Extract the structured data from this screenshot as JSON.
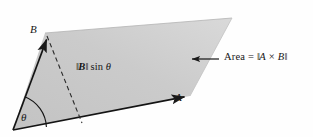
{
  "figure": {
    "background_color": "#fefefe",
    "fill_color": "#c9c9c9",
    "stroke_color": "#1a1a1a"
  },
  "labels": {
    "vector_b": "B",
    "vector_a": "A",
    "angle": "θ",
    "height_bar_open": "‖",
    "height_vector": "B",
    "height_bar_close": "‖",
    "height_function": " sin ",
    "height_angle": "θ",
    "area_word": "Area",
    "area_equals": "=",
    "area_bar_open": "‖",
    "area_first": "A",
    "area_times": "×",
    "area_second": "B",
    "area_bar_close": "‖"
  },
  "geometry": {
    "origin": [
      13,
      130
    ],
    "tip_a": [
      190,
      96
    ],
    "tip_b": [
      45,
      33
    ],
    "far_corner": [
      232,
      18
    ],
    "altitude_foot": [
      82,
      123
    ],
    "leader_arrow_from": [
      219,
      59
    ],
    "leader_arrow_to": [
      190,
      59
    ],
    "angle_arc_radius": 34
  }
}
